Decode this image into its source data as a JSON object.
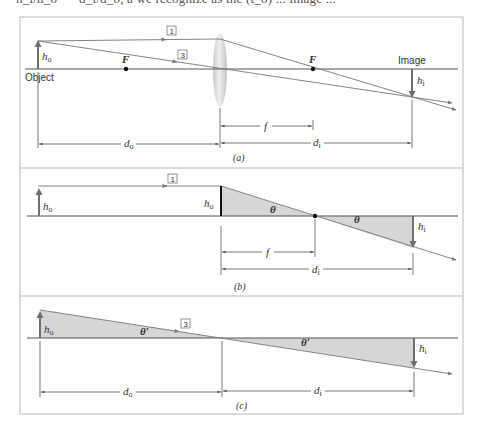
{
  "header_fragment": {
    "text": "h_i/h_o  = −d_i/d_o, a we recognize as the (t_o) ... image ..."
  },
  "colors": {
    "frame": "#b9b9b9",
    "axis": "#555555",
    "ray": "#777777",
    "arrow_fill": "#6f6f6f",
    "shade": "#d6d6d6",
    "lens": "#d9d9d9",
    "text": "#333333"
  },
  "panel_a": {
    "caption": "(a)",
    "object_label": "Object",
    "image_label": "Image",
    "ho_label": "h",
    "ho_sub": "o",
    "hi_label": "h",
    "hi_sub": "i",
    "focal_left": "F",
    "focal_right": "F",
    "ray1_label": "1",
    "ray3_label": "3",
    "f_label": "f",
    "do_label": "d",
    "do_sub": "o",
    "di_label": "d",
    "di_sub": "i"
  },
  "panel_b": {
    "caption": "(b)",
    "ho_label": "h",
    "ho_sub": "o",
    "ho_lens_label": "h",
    "ho_lens_sub": "o",
    "hi_label": "h",
    "hi_sub": "i",
    "ray1_label": "1",
    "theta1": "θ",
    "theta2": "θ",
    "f_label": "f",
    "di_label": "d",
    "di_sub": "i"
  },
  "panel_c": {
    "caption": "(c)",
    "ho_label": "h",
    "ho_sub": "o",
    "hi_label": "h",
    "hi_sub": "i",
    "ray3_label": "3",
    "theta1": "θ′",
    "theta2": "θ′",
    "do_label": "d",
    "do_sub": "o",
    "di_label": "d",
    "di_sub": "i"
  }
}
